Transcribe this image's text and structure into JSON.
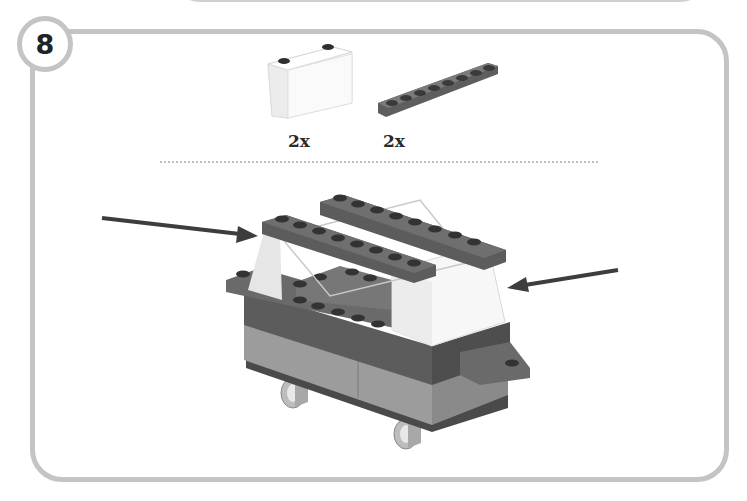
{
  "step": {
    "number": "8"
  },
  "parts": [
    {
      "name": "slope brick 2x2 (white, 2 studs)",
      "color": "#f5f5f5",
      "quantity": "2x"
    },
    {
      "name": "plate 1x8 (dark gray)",
      "color": "#6b6b6b",
      "quantity": "2x"
    }
  ],
  "assembly": {
    "arrows": [
      {
        "direction": "right",
        "target": "left white slope"
      },
      {
        "direction": "left",
        "target": "right white slope"
      }
    ],
    "colors": {
      "dark_gray": "#5f5f5f",
      "medium_gray": "#8a8a8a",
      "light_gray": "#a9a9a9",
      "white": "#f4f4f4",
      "stud_dark": "#3a3a3a",
      "frame": "#c4c4c4"
    }
  }
}
